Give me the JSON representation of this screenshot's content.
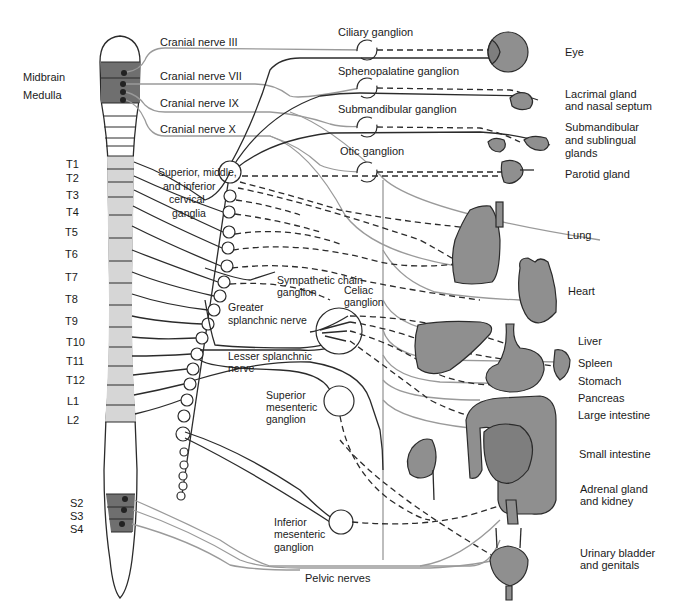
{
  "spinal_cord": {
    "brain_labels": [
      "Midbrain",
      "Medulla"
    ],
    "segment_labels": [
      "T1",
      "T2",
      "T3",
      "T4",
      "T5",
      "T6",
      "T7",
      "T8",
      "T9",
      "T10",
      "T11",
      "T12",
      "L1",
      "L2"
    ],
    "sacral_labels": [
      "S2",
      "S3",
      "S4"
    ]
  },
  "cranial_nerves": [
    "Cranial nerve III",
    "Cranial nerve VII",
    "Cranial nerve IX",
    "Cranial nerve X"
  ],
  "ganglia": {
    "ciliary": "Ciliary ganglion",
    "sphenopalatine": "Sphenopalatine ganglion",
    "submandibular": "Submandibular ganglion",
    "otic": "Otic ganglion",
    "cervical": [
      "Superior, middle,",
      "and inferior",
      "cervical",
      "ganglia"
    ],
    "sympathetic_chain": [
      "Sympathetic chain",
      "ganglion"
    ],
    "celiac": [
      "Celiac",
      "ganglion"
    ],
    "superior_mesenteric": [
      "Superior",
      "mesenteric",
      "ganglion"
    ],
    "inferior_mesenteric": [
      "Inferior",
      "mesenteric",
      "ganglion"
    ]
  },
  "nerves": {
    "greater_splanchnic": [
      "Greater",
      "splanchnic nerve"
    ],
    "lesser_splanchnic": [
      "Lesser splanchnic",
      "nerve"
    ],
    "pelvic": "Pelvic nerves"
  },
  "organs": [
    {
      "id": "eye",
      "lines": [
        "Eye"
      ]
    },
    {
      "id": "lacrimal",
      "lines": [
        "Lacrimal gland",
        "and nasal septum"
      ]
    },
    {
      "id": "submandibular",
      "lines": [
        "Submandibular",
        "and sublingual",
        "glands"
      ]
    },
    {
      "id": "parotid",
      "lines": [
        "Parotid gland"
      ]
    },
    {
      "id": "lung",
      "lines": [
        "Lung"
      ]
    },
    {
      "id": "heart",
      "lines": [
        "Heart"
      ]
    },
    {
      "id": "liver",
      "lines": [
        "Liver"
      ]
    },
    {
      "id": "spleen",
      "lines": [
        "Spleen"
      ]
    },
    {
      "id": "stomach",
      "lines": [
        "Stomach"
      ]
    },
    {
      "id": "pancreas",
      "lines": [
        "Pancreas"
      ]
    },
    {
      "id": "large-intestine",
      "lines": [
        "Large intestine"
      ]
    },
    {
      "id": "small-intestine",
      "lines": [
        "Small intestine"
      ]
    },
    {
      "id": "adrenal-kidney",
      "lines": [
        "Adrenal gland",
        "and kidney"
      ]
    },
    {
      "id": "bladder",
      "lines": [
        "Urinary bladder",
        "and genitals"
      ]
    }
  ],
  "colors": {
    "parasympathetic": "#9a9a9a",
    "sympathetic": "#2b2b2b",
    "organ_fill": "#8f8f8f",
    "thoracolumbar_segment": "#d6d6d6",
    "brain_sacral_segment": "#6f6f6f"
  }
}
